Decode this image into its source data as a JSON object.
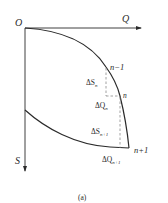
{
  "diagram": {
    "caption": "(a)",
    "axes": {
      "origin_label": "O",
      "x_label": "Q",
      "y_label": "S"
    },
    "points": [
      {
        "id": "n_minus_1",
        "label": "n−1"
      },
      {
        "id": "n",
        "label": "n"
      },
      {
        "id": "n_plus_1",
        "label": "n+1"
      }
    ],
    "increments": {
      "dS_n": {
        "base": "ΔS",
        "sub": "n"
      },
      "dQ_n": {
        "base": "ΔQ",
        "sub": "n"
      },
      "dS_n1": {
        "base": "ΔS",
        "sub": "n+1"
      },
      "dQ_n1": {
        "base": "ΔQ",
        "sub": "n+1"
      }
    },
    "colors": {
      "ink": "#2a2a2a",
      "dashed": "#8a8a8a",
      "background": "#ffffff"
    }
  }
}
